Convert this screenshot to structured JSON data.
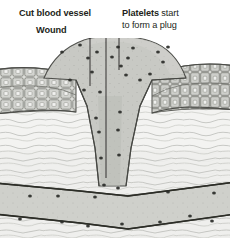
{
  "figure": {
    "title_alt": "Wound healing: platelet plug formation in cut blood vessel",
    "background": "#ffffff",
    "palette": {
      "ink": "#231f20",
      "epidermis_fill": "#d9dad6",
      "epidermis_line": "#6b6c68",
      "dermis_fill": "#f2f2f0",
      "dermis_line": "#b9bab6",
      "clot_fill": "#c9cac5",
      "clot_line": "#555652",
      "vessel_fill": "#cfd0cb",
      "vessel_line": "#3a3b37",
      "rbc_fill": "#4a4b47",
      "rbc_core": "#1e1f1c",
      "wbc_fill": "#ffffff",
      "wbc_line": "#2a2b28",
      "platelet": "#2a2b28"
    }
  },
  "labels": {
    "cut_vessel": "Cut blood vessel",
    "wound": "Wound",
    "platelets_bold": "Platelets",
    "platelets_rest": " start",
    "platelets_line2": "to form a plug"
  },
  "leaders": [
    {
      "name": "leader-wound",
      "x1": 90,
      "y1": 34,
      "x2": 90,
      "y2": 86
    },
    {
      "name": "leader-cut-vessel",
      "x1": 106,
      "y1": 17,
      "x2": 106,
      "y2": 178
    },
    {
      "name": "leader-platelets",
      "x1": 119,
      "y1": 6,
      "x2": 119,
      "y2": 70
    }
  ],
  "structures": [
    {
      "name": "epidermis",
      "label_alt": "Epidermis cell layer",
      "rows": 3
    },
    {
      "name": "dermis",
      "label_alt": "Fibrous dermis"
    },
    {
      "name": "clot",
      "label_alt": "Platelet plug / clot over wound"
    },
    {
      "name": "blood-vessel",
      "label_alt": "Blood vessel lumen"
    }
  ],
  "cells": {
    "clot_red_cells": [
      {
        "cx": 75,
        "cy": 63,
        "r": 10.5,
        "rot": -12
      },
      {
        "cx": 105,
        "cy": 74,
        "r": 10.0,
        "rot": 8
      },
      {
        "cx": 143,
        "cy": 60,
        "r": 10.5,
        "rot": 14
      },
      {
        "cx": 93,
        "cy": 104,
        "r": 9.6,
        "rot": -5
      },
      {
        "cx": 108,
        "cy": 143,
        "r": 9.2,
        "rot": 10
      },
      {
        "cx": 111,
        "cy": 176,
        "r": 8.2,
        "rot": -8
      }
    ],
    "clot_white_cells": [
      {
        "cx": 131,
        "cy": 95,
        "rx": 12.5,
        "ry": 11.5,
        "rot": -6
      }
    ],
    "vessel_red_cells": [
      {
        "cx": 8,
        "cy": 201,
        "r": 9.2,
        "rot": -6
      },
      {
        "cx": 44,
        "cy": 208,
        "r": 9.6,
        "rot": 6
      },
      {
        "cx": 105,
        "cy": 214,
        "r": 9.6,
        "rot": -3
      },
      {
        "cx": 151,
        "cy": 205,
        "r": 9.0,
        "rot": 12
      },
      {
        "cx": 200,
        "cy": 199,
        "r": 9.2,
        "rot": -10
      }
    ],
    "vessel_white_cells": [
      {
        "cx": 75,
        "cy": 208,
        "rx": 13.0,
        "ry": 11.0,
        "rot": -4
      },
      {
        "cx": 140,
        "cy": 211,
        "rx": 12.5,
        "ry": 11.0,
        "rot": 5
      },
      {
        "cx": 176,
        "cy": 201,
        "rx": 11.5,
        "ry": 10.0,
        "rot": -6
      }
    ],
    "platelets": [
      {
        "cx": 62,
        "cy": 52
      },
      {
        "cx": 70,
        "cy": 80
      },
      {
        "cx": 80,
        "cy": 45
      },
      {
        "cx": 88,
        "cy": 58
      },
      {
        "cx": 92,
        "cy": 72
      },
      {
        "cx": 84,
        "cy": 90
      },
      {
        "cx": 97,
        "cy": 52
      },
      {
        "cx": 100,
        "cy": 92
      },
      {
        "cx": 112,
        "cy": 57
      },
      {
        "cx": 118,
        "cy": 47
      },
      {
        "cx": 121,
        "cy": 66
      },
      {
        "cx": 126,
        "cy": 75
      },
      {
        "cx": 128,
        "cy": 58
      },
      {
        "cx": 133,
        "cy": 48
      },
      {
        "cx": 140,
        "cy": 80
      },
      {
        "cx": 150,
        "cy": 74
      },
      {
        "cx": 158,
        "cy": 52
      },
      {
        "cx": 163,
        "cy": 62
      },
      {
        "cx": 168,
        "cy": 47
      },
      {
        "cx": 96,
        "cy": 118
      },
      {
        "cx": 120,
        "cy": 112
      },
      {
        "cx": 99,
        "cy": 132
      },
      {
        "cx": 118,
        "cy": 130
      },
      {
        "cx": 101,
        "cy": 158
      },
      {
        "cx": 119,
        "cy": 155
      },
      {
        "cx": 104,
        "cy": 185
      },
      {
        "cx": 118,
        "cy": 188
      },
      {
        "cx": 30,
        "cy": 196
      },
      {
        "cx": 58,
        "cy": 196
      },
      {
        "cx": 62,
        "cy": 222
      },
      {
        "cx": 95,
        "cy": 197
      },
      {
        "cx": 122,
        "cy": 224
      },
      {
        "cx": 160,
        "cy": 222
      },
      {
        "cx": 168,
        "cy": 192
      },
      {
        "cx": 190,
        "cy": 216
      },
      {
        "cx": 214,
        "cy": 193
      },
      {
        "cx": 20,
        "cy": 219
      },
      {
        "cx": 88,
        "cy": 226
      },
      {
        "cx": 212,
        "cy": 221
      }
    ]
  }
}
